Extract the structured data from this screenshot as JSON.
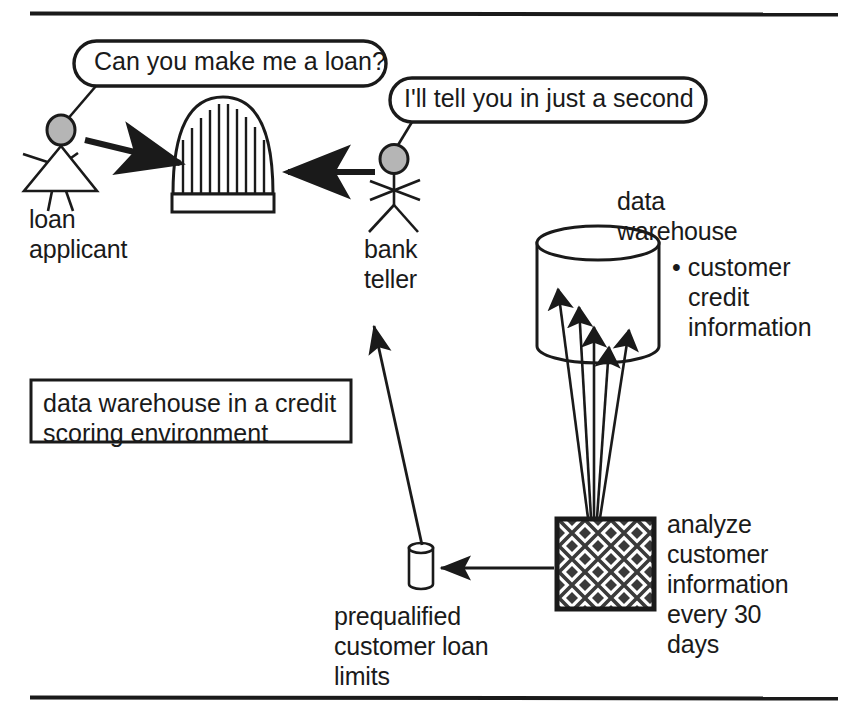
{
  "figure": {
    "caption": "data warehouse in a credit\nscoring environment",
    "rules": {
      "top_y": 13,
      "bottom_y": 698,
      "x_start": 30,
      "x_end": 838
    }
  },
  "speech_bubbles": [
    {
      "id": "applicant-question",
      "text": "Can you make me a loan?",
      "speaker": "loan applicant"
    },
    {
      "id": "teller-answer",
      "text": "I'll tell you in just a second",
      "speaker": "bank teller"
    }
  ],
  "actors": [
    {
      "id": "loan-applicant",
      "label": "loan\napplicant"
    },
    {
      "id": "bank-teller",
      "label": "bank\nteller"
    }
  ],
  "nodes": [
    {
      "id": "bank-building",
      "label": ""
    },
    {
      "id": "data-warehouse",
      "label": "data\nwarehouse"
    },
    {
      "id": "data-warehouse-contents",
      "label": "• customer\ncredit\ninformation"
    },
    {
      "id": "analyze-process",
      "label": "analyze\ncustomer\ninformation\nevery 30\ndays"
    },
    {
      "id": "prequalified-store",
      "label": "prequalified\ncustomer loan\nlimits"
    }
  ],
  "colors": {
    "stroke": "#1a1a1a",
    "head_fill": "#b5b5b5",
    "background": "#ffffff",
    "pattern_fill": "#3a3a3a"
  }
}
